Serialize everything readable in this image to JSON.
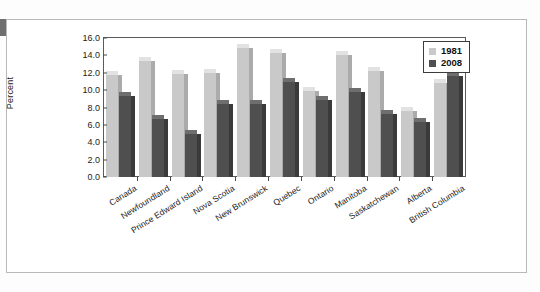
{
  "chart_data": {
    "type": "bar",
    "title": "",
    "xlabel": "",
    "ylabel": "Percent",
    "ylim": [
      0.0,
      16.0
    ],
    "ytick_step": 2.0,
    "yticks": [
      "0.0",
      "2.0",
      "4.0",
      "6.0",
      "8.0",
      "10.0",
      "12.0",
      "14.0",
      "16.0"
    ],
    "grid": false,
    "legend_position": "top-right",
    "categories": [
      "Canada",
      "Newfoundland",
      "Prince Edward Island",
      "Nova Scotia",
      "New Brunswick",
      "Quebec",
      "Ontario",
      "Manitoba",
      "Saskatchewan",
      "Alberta",
      "British Columbia"
    ],
    "series": [
      {
        "name": "1981",
        "color": "#c9c9c9",
        "values": [
          11.7,
          13.4,
          11.9,
          12.0,
          14.8,
          14.3,
          9.9,
          14.1,
          12.2,
          7.6,
          10.8
        ]
      },
      {
        "name": "2008",
        "color": "#4f4f4f",
        "values": [
          9.3,
          6.7,
          5.0,
          8.4,
          8.4,
          10.9,
          8.9,
          9.8,
          7.2,
          6.3,
          11.6
        ]
      }
    ]
  },
  "legend": {
    "items": [
      {
        "label": "1981"
      },
      {
        "label": "2008"
      }
    ]
  },
  "axes": {
    "y_label": "Percent"
  },
  "colors": {
    "series_1981": "#c9c9c9",
    "series_2008": "#4f4f4f",
    "axis": "#5a5a5a",
    "frame": "#b9b9b9",
    "text": "#1c1c1c"
  }
}
